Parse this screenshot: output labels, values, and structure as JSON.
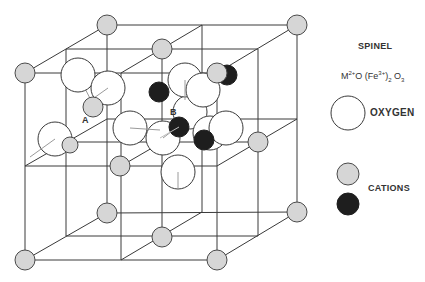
{
  "legend": {
    "title": "SPINEL",
    "formula": {
      "m": "M",
      "m_sup": "2+",
      "o1": "O (Fe",
      "fe_sup": "3+",
      "close": ")",
      "sub2": "2",
      "o2": " O",
      "sub3": "3"
    },
    "oxygen_label": "OXYGEN",
    "cations_label": "CATIONS"
  },
  "site_labels": {
    "a": "A",
    "b": "B"
  },
  "colors": {
    "line": "#3a3a3a",
    "oxygen_fill": "#ffffff",
    "cation_a_fill": "#d6d6d6",
    "cation_b_fill": "#1e1e1e"
  },
  "structure": {
    "name": "Spinel unit cell",
    "atoms": {
      "oxygen_count_shown": 14,
      "tetrahedral_A_shown": "gray",
      "octahedral_B_shown": "black"
    }
  }
}
